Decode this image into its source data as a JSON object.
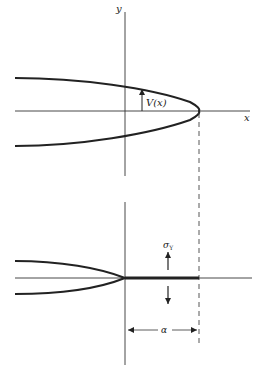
{
  "upper_figure": {
    "y_axis_label": "y",
    "x_axis_label": "x",
    "displacement_label": "V(x)"
  },
  "lower_figure": {
    "stress_label": "σ",
    "stress_subscript": "Y",
    "dimension_label": "α"
  },
  "colors": {
    "stroke": "#222222",
    "background": "#ffffff"
  }
}
